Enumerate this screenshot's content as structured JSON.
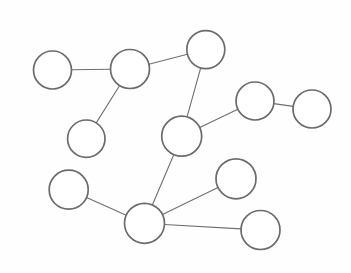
{
  "canvas": {
    "width": 351,
    "height": 273,
    "background_color": "#fefefe"
  },
  "style": {
    "node_fill": "#ffffff",
    "node_stroke": "#6b6b6b",
    "node_stroke_width": 1.7,
    "edge_stroke": "#6f6f6f",
    "edge_stroke_width": 1.1
  },
  "graph": {
    "type": "node-link-diagram",
    "node_count": 11,
    "edge_count": 10,
    "nodes": [
      {
        "id": "n1",
        "name": "node-top-left",
        "cx": 52.5,
        "cy": 70.0,
        "r": 19.0,
        "label": ""
      },
      {
        "id": "n2",
        "name": "node-upper-left-mid",
        "cx": 130.0,
        "cy": 69.0,
        "r": 19.5,
        "label": ""
      },
      {
        "id": "n3",
        "name": "node-top-center",
        "cx": 205.8,
        "cy": 49.6,
        "r": 19.0,
        "label": ""
      },
      {
        "id": "n4",
        "name": "node-left-mid",
        "cx": 86.3,
        "cy": 138.7,
        "r": 18.7,
        "label": ""
      },
      {
        "id": "n5",
        "name": "node-center",
        "cx": 181.7,
        "cy": 136.2,
        "r": 20.0,
        "label": ""
      },
      {
        "id": "n6",
        "name": "node-right-upper",
        "cx": 255.0,
        "cy": 101.0,
        "r": 19.0,
        "label": ""
      },
      {
        "id": "n7",
        "name": "node-far-right",
        "cx": 312.0,
        "cy": 109.0,
        "r": 19.0,
        "label": ""
      },
      {
        "id": "n8",
        "name": "node-lower-left",
        "cx": 68.7,
        "cy": 189.7,
        "r": 19.5,
        "label": ""
      },
      {
        "id": "n9",
        "name": "node-bottom-hub",
        "cx": 144.5,
        "cy": 223.3,
        "r": 20.0,
        "label": ""
      },
      {
        "id": "n10",
        "name": "node-lower-right-upper",
        "cx": 236.0,
        "cy": 178.8,
        "r": 20.0,
        "label": ""
      },
      {
        "id": "n11",
        "name": "node-bottom-right",
        "cx": 260.5,
        "cy": 230.0,
        "r": 19.5,
        "label": ""
      }
    ],
    "edges": [
      {
        "id": "e1",
        "name": "edge-top-left-to-upper-left-mid",
        "source": "n1",
        "target": "n2"
      },
      {
        "id": "e2",
        "name": "edge-upper-left-mid-to-top-center",
        "source": "n2",
        "target": "n3"
      },
      {
        "id": "e3",
        "name": "edge-upper-left-mid-to-left-mid",
        "source": "n2",
        "target": "n4"
      },
      {
        "id": "e4",
        "name": "edge-top-center-to-center",
        "source": "n3",
        "target": "n5"
      },
      {
        "id": "e5",
        "name": "edge-center-to-right-upper",
        "source": "n5",
        "target": "n6"
      },
      {
        "id": "e6",
        "name": "edge-right-upper-to-far-right",
        "source": "n6",
        "target": "n7"
      },
      {
        "id": "e7",
        "name": "edge-center-to-bottom-hub",
        "source": "n5",
        "target": "n9"
      },
      {
        "id": "e8",
        "name": "edge-lower-left-to-bottom-hub",
        "source": "n8",
        "target": "n9"
      },
      {
        "id": "e9",
        "name": "edge-bottom-hub-to-lower-right",
        "source": "n9",
        "target": "n10"
      },
      {
        "id": "e10",
        "name": "edge-bottom-hub-to-bottom-right",
        "source": "n9",
        "target": "n11"
      }
    ]
  }
}
